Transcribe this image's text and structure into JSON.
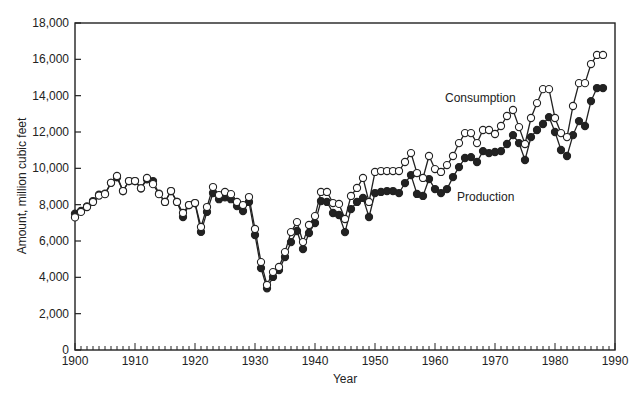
{
  "chart_data": {
    "type": "line",
    "title": "",
    "xlabel": "Year",
    "ylabel": "Amount, million cubic feet",
    "xlim": [
      1900,
      1990
    ],
    "ylim": [
      0,
      18000
    ],
    "x_ticks": [
      1900,
      1910,
      1920,
      1930,
      1940,
      1950,
      1960,
      1970,
      1980,
      1990
    ],
    "x_tick_labels": [
      "1900",
      "1910",
      "1920",
      "1930",
      "1940",
      "1950",
      "1960",
      "1970",
      "1980",
      "1990"
    ],
    "y_ticks": [
      0,
      2000,
      4000,
      6000,
      8000,
      10000,
      12000,
      14000,
      16000,
      18000
    ],
    "y_tick_labels": [
      "0",
      "2,000",
      "4,000",
      "6,000",
      "8,000",
      "10,000",
      "12,000",
      "14,000",
      "16,000",
      "18,000"
    ],
    "grid": false,
    "legend": "inline labels near series",
    "x": [
      1900,
      1901,
      1902,
      1903,
      1904,
      1905,
      1906,
      1907,
      1908,
      1909,
      1910,
      1911,
      1912,
      1913,
      1914,
      1915,
      1916,
      1917,
      1918,
      1919,
      1920,
      1921,
      1922,
      1923,
      1924,
      1925,
      1926,
      1927,
      1928,
      1929,
      1930,
      1931,
      1932,
      1933,
      1934,
      1935,
      1936,
      1937,
      1938,
      1939,
      1940,
      1941,
      1942,
      1943,
      1944,
      1945,
      1946,
      1947,
      1948,
      1949,
      1950,
      1951,
      1952,
      1953,
      1954,
      1955,
      1956,
      1957,
      1958,
      1959,
      1960,
      1961,
      1962,
      1963,
      1964,
      1965,
      1966,
      1967,
      1968,
      1969,
      1970,
      1971,
      1972,
      1973,
      1974,
      1975,
      1976,
      1977,
      1978,
      1979,
      1980,
      1981,
      1982,
      1983,
      1984,
      1985,
      1986,
      1987,
      1988
    ],
    "series": [
      {
        "name": "Consumption",
        "marker": "open-circle",
        "label_pos": [
          445,
          102
        ],
        "values": [
          7300,
          7600,
          7870,
          8150,
          8500,
          8580,
          9200,
          9580,
          8750,
          9300,
          9300,
          8900,
          9470,
          9130,
          8580,
          8150,
          8750,
          8150,
          7540,
          7980,
          8090,
          6770,
          7870,
          8970,
          8530,
          8700,
          8580,
          8150,
          7980,
          8420,
          6660,
          4840,
          3580,
          4290,
          4570,
          5390,
          6490,
          7040,
          5940,
          6880,
          7370,
          8700,
          8700,
          8090,
          8040,
          7210,
          8480,
          8920,
          9470,
          8150,
          9800,
          9850,
          9850,
          9850,
          9850,
          10350,
          10840,
          9740,
          9470,
          10680,
          9960,
          9800,
          10180,
          10680,
          11390,
          11940,
          11940,
          11390,
          12110,
          12110,
          11890,
          12330,
          12880,
          13210,
          12270,
          11340,
          12770,
          13590,
          14360,
          14360,
          12770,
          11940,
          11720,
          13430,
          14690,
          14690,
          15740,
          16240,
          16240
        ]
      },
      {
        "name": "Production",
        "marker": "filled-circle",
        "label_pos": [
          457,
          201
        ],
        "values": [
          7500,
          7650,
          7900,
          8200,
          8550,
          8600,
          9200,
          9500,
          8750,
          9300,
          9300,
          8900,
          9400,
          9300,
          8600,
          8150,
          8750,
          8150,
          7320,
          7980,
          8090,
          6500,
          7600,
          8640,
          8300,
          8400,
          8300,
          7920,
          7650,
          8150,
          6330,
          4510,
          3400,
          4020,
          4400,
          5120,
          5940,
          6550,
          5560,
          6440,
          6990,
          8200,
          8150,
          7540,
          7430,
          6490,
          7760,
          8150,
          8370,
          7320,
          8640,
          8700,
          8750,
          8750,
          8640,
          9190,
          9630,
          8590,
          8480,
          9410,
          8860,
          8640,
          8860,
          9520,
          10070,
          10570,
          10620,
          10350,
          10950,
          10840,
          10900,
          10950,
          11340,
          11830,
          11390,
          10460,
          11720,
          12110,
          12440,
          12820,
          12000,
          11010,
          10680,
          11830,
          12600,
          12330,
          13700,
          14420,
          14420
        ]
      }
    ]
  },
  "layout": {
    "plot_left": 75,
    "plot_right": 615,
    "plot_top": 23,
    "plot_bottom": 350,
    "ink_color": "#222222",
    "background": "#ffffff"
  }
}
